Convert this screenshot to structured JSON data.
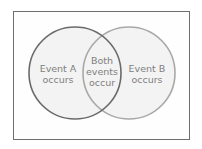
{
  "diagram": {
    "type": "venn",
    "sets": [
      {
        "id": "A",
        "label_lines": [
          "Event A",
          "occurs"
        ],
        "stroke": "#6a6a6a"
      },
      {
        "id": "B",
        "label_lines": [
          "Event B",
          "occurs"
        ],
        "stroke": "#a8a8a8"
      }
    ],
    "intersection": {
      "label_lines": [
        "Both",
        "events",
        "occur"
      ]
    },
    "colors": {
      "frame": "#6e6e6e",
      "fill": "#f3f3f3",
      "text": "#808080"
    }
  }
}
